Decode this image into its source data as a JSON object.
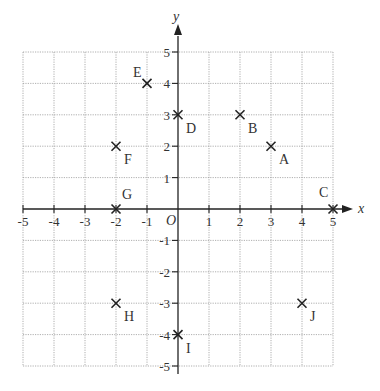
{
  "chart_data": {
    "type": "scatter",
    "title": "",
    "xlabel": "x",
    "ylabel": "y",
    "origin_label": "O",
    "xlim": [
      -5,
      5
    ],
    "ylim": [
      -5,
      5
    ],
    "grid": true,
    "x_ticks": [
      -5,
      -4,
      -3,
      -2,
      -1,
      1,
      2,
      3,
      4,
      5
    ],
    "y_ticks": [
      -5,
      -4,
      -3,
      -2,
      -1,
      1,
      2,
      3,
      4,
      5
    ],
    "points": [
      {
        "label": "A",
        "x": 3,
        "y": 2
      },
      {
        "label": "B",
        "x": 2,
        "y": 3
      },
      {
        "label": "C",
        "x": 5,
        "y": 0
      },
      {
        "label": "D",
        "x": 0,
        "y": 3
      },
      {
        "label": "E",
        "x": -1,
        "y": 4
      },
      {
        "label": "F",
        "x": -2,
        "y": 2
      },
      {
        "label": "G",
        "x": -2,
        "y": 0
      },
      {
        "label": "H",
        "x": -2,
        "y": -3
      },
      {
        "label": "I",
        "x": 0,
        "y": -4
      },
      {
        "label": "J",
        "x": 4,
        "y": -3
      }
    ],
    "marker": "x",
    "colors": {
      "axis": "#222222",
      "grid": "#9a9a9a",
      "text": "#333333"
    }
  }
}
